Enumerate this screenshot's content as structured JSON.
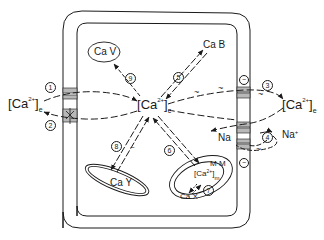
{
  "diagram": {
    "colors": {
      "stroke": "#1a1a1a",
      "channel_fill": "#b8b8b8",
      "background": "#ffffff"
    },
    "labels": {
      "ca_extracellular_left": {
        "base": "Ca",
        "sup": "2+",
        "sub": "e"
      },
      "ca_cytosolic": {
        "base": "Ca",
        "sup": "2+",
        "sub": "c"
      },
      "ca_extracellular_right": {
        "base": "Ca",
        "sup": "2+",
        "sub": "e"
      },
      "ca_mito": {
        "base": "Ca",
        "sup": "2+",
        "sub": "m"
      },
      "cav": "Ca V",
      "cab": "Ca B",
      "cay": "Ca Y",
      "cax": "Ca X",
      "mm": "M M",
      "na_in": "Na",
      "na_out": "Na",
      "na_out_sup": "+"
    },
    "pathways": [
      {
        "num": "1",
        "from": "[Ca2+]e",
        "to": "[Ca2+]c",
        "via": "plasma membrane channel (left, top)"
      },
      {
        "num": "2",
        "from": "[Ca2+]c",
        "to": "[Ca2+]e",
        "via": "plasma membrane channel (left, bottom)"
      },
      {
        "num": "3",
        "from": "[Ca2+]c",
        "to": "[Ca2+]e",
        "via": "plasma membrane pump (right, top)",
        "energy": "~"
      },
      {
        "num": "4",
        "from": "Na+",
        "to": "Na",
        "via": "Na/Ca exchanger (right, bottom)",
        "energy": "~"
      },
      {
        "num": "5",
        "from": "[Ca2+]c",
        "to": "Ca B",
        "via": "binding (bidirectional)"
      },
      {
        "num": "6",
        "from": "[Ca2+]c",
        "to": "[Ca2+]m",
        "via": "mitochondrial membrane (bidirectional)"
      },
      {
        "num": "7",
        "from": "[Ca2+]m",
        "to": "Ca X",
        "via": "mitochondrial binding (bidirectional)"
      },
      {
        "num": "8",
        "from": "[Ca2+]c",
        "to": "Ca Y",
        "via": "reticulum (bidirectional)"
      },
      {
        "num": "9",
        "from": "[Ca2+]c",
        "to": "Ca V",
        "via": "vesicle uptake"
      }
    ],
    "charges": [
      "−",
      "−",
      "−"
    ]
  }
}
